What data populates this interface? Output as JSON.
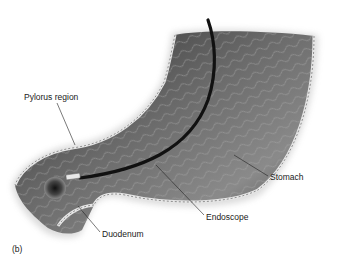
{
  "figure": {
    "panel_label": "(b)",
    "labels": {
      "pylorus": "Pylorus region",
      "stomach": "Stomach",
      "endoscope": "Endoscope",
      "duodenum": "Duodenum"
    },
    "colors": {
      "background": "#ffffff",
      "tissue_dark": "#3a3a3a",
      "tissue_mid": "#6e6e6e",
      "tissue_light": "#b5b5b5",
      "wall": "#d9d9d9",
      "endoscope": "#111111",
      "leader_line": "#222222"
    }
  }
}
